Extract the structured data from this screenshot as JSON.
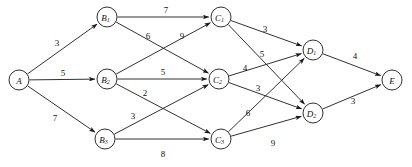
{
  "diagram": {
    "type": "directed-weighted-graph",
    "canvas": {
      "width": 412,
      "height": 167,
      "background": "#ffffff"
    },
    "style": {
      "stroke": "#1a1a1a",
      "node_fill": "#ffffff",
      "node_radius": 10
    },
    "nodes": [
      {
        "id": "A",
        "base": "A",
        "sub": "",
        "x": 19,
        "y": 80,
        "layer": 0
      },
      {
        "id": "B1",
        "base": "B",
        "sub": "1",
        "x": 107,
        "y": 17,
        "layer": 1
      },
      {
        "id": "B2",
        "base": "B",
        "sub": "2",
        "x": 107,
        "y": 79,
        "layer": 1
      },
      {
        "id": "B3",
        "base": "B",
        "sub": "3",
        "x": 105,
        "y": 139,
        "layer": 1
      },
      {
        "id": "C1",
        "base": "C",
        "sub": "1",
        "x": 221,
        "y": 17,
        "layer": 2
      },
      {
        "id": "C2",
        "base": "C",
        "sub": "2",
        "x": 219,
        "y": 79,
        "layer": 2
      },
      {
        "id": "C3",
        "base": "C",
        "sub": "3",
        "x": 221,
        "y": 139,
        "layer": 2
      },
      {
        "id": "D1",
        "base": "D",
        "sub": "1",
        "x": 313,
        "y": 50,
        "layer": 3
      },
      {
        "id": "D2",
        "base": "D",
        "sub": "2",
        "x": 313,
        "y": 113,
        "layer": 3
      },
      {
        "id": "E",
        "base": "E",
        "sub": "",
        "x": 392,
        "y": 80,
        "layer": 4
      }
    ],
    "edges": [
      {
        "from": "A",
        "to": "B1",
        "weight": "3",
        "lx": 57,
        "ly": 43
      },
      {
        "from": "A",
        "to": "B2",
        "weight": "5",
        "lx": 63,
        "ly": 73
      },
      {
        "from": "A",
        "to": "B3",
        "weight": "7",
        "lx": 55,
        "ly": 118
      },
      {
        "from": "B1",
        "to": "C1",
        "weight": "7",
        "lx": 166,
        "ly": 10
      },
      {
        "from": "B1",
        "to": "C2",
        "weight": "6",
        "lx": 148,
        "ly": 36
      },
      {
        "from": "B2",
        "to": "C1",
        "weight": "9",
        "lx": 182,
        "ly": 36
      },
      {
        "from": "B2",
        "to": "C2",
        "weight": "5",
        "lx": 163,
        "ly": 72
      },
      {
        "from": "B2",
        "to": "C3",
        "weight": "2",
        "lx": 145,
        "ly": 93
      },
      {
        "from": "B3",
        "to": "C2",
        "weight": "3",
        "lx": 133,
        "ly": 116
      },
      {
        "from": "B3",
        "to": "C3",
        "weight": "8",
        "lx": 163,
        "ly": 154
      },
      {
        "from": "C1",
        "to": "D1",
        "weight": "3",
        "lx": 265,
        "ly": 29
      },
      {
        "from": "C1",
        "to": "D2",
        "weight": "5",
        "lx": 262,
        "ly": 54
      },
      {
        "from": "C2",
        "to": "D1",
        "weight": "4",
        "lx": 245,
        "ly": 68
      },
      {
        "from": "C2",
        "to": "D2",
        "weight": "3",
        "lx": 258,
        "ly": 88
      },
      {
        "from": "C3",
        "to": "D1",
        "weight": "6",
        "lx": 248,
        "ly": 113
      },
      {
        "from": "C3",
        "to": "D2",
        "weight": "9",
        "lx": 273,
        "ly": 143
      },
      {
        "from": "D1",
        "to": "E",
        "weight": "4",
        "lx": 355,
        "ly": 56
      },
      {
        "from": "D2",
        "to": "E",
        "weight": "3",
        "lx": 353,
        "ly": 101
      }
    ]
  }
}
